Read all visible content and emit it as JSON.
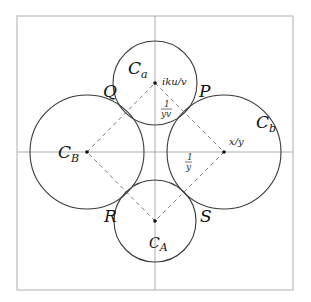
{
  "diagram": {
    "circles": [
      {
        "id": "Ca",
        "label_main": "C",
        "label_sub": "a",
        "center": [
          155,
          83
        ],
        "radius": 42,
        "center_annotation": "iku/v"
      },
      {
        "id": "Cb",
        "label_main": "C",
        "label_sub": "b",
        "center": [
          224,
          152
        ],
        "radius": 57,
        "center_annotation": "x/y"
      },
      {
        "id": "CB",
        "label_main": "C",
        "label_sub": "B",
        "center": [
          87,
          152
        ],
        "radius": 57
      },
      {
        "id": "CA",
        "label_main": "C",
        "label_sub": "A",
        "center": [
          155,
          221
        ],
        "radius": 41
      }
    ],
    "tangent_points": {
      "P": "P",
      "Q": "Q",
      "R": "R",
      "S": "S"
    },
    "edge_labels": {
      "top_right_frac_num": "1",
      "top_right_frac_den": "yv",
      "right_frac_num": "1",
      "right_frac_den": "y"
    },
    "annotations": {
      "ca_center": "iku/v",
      "cb_center": "x/y"
    },
    "colors": {
      "frame": "#bdbdbd",
      "axis": "#9a9a9a",
      "circle": "#3a3a3a",
      "dash": "#6a6a6a"
    }
  }
}
